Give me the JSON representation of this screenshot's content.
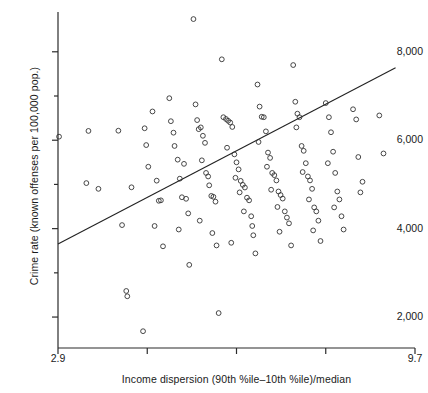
{
  "chart_data": {
    "type": "scatter",
    "title": "",
    "xlabel": "Income dispersion (90th %ile–10th %ile)/median",
    "ylabel": "Crime rate (known offenses per 100,000 pop.)",
    "xlim": [
      2.9,
      9.7
    ],
    "ylim": [
      1300,
      8900
    ],
    "grid": false,
    "legend": null,
    "xticks": [
      {
        "value": 2.9,
        "label": "2.9"
      },
      {
        "value": 4.6,
        "label": ""
      },
      {
        "value": 6.3,
        "label": ""
      },
      {
        "value": 8.0,
        "label": ""
      },
      {
        "value": 9.7,
        "label": "9.7"
      }
    ],
    "yticks": [
      {
        "value": 2000,
        "label": "2,000"
      },
      {
        "value": 3000,
        "label": ""
      },
      {
        "value": 4000,
        "label": "4,000"
      },
      {
        "value": 5000,
        "label": ""
      },
      {
        "value": 6000,
        "label": "6,000"
      },
      {
        "value": 7000,
        "label": ""
      },
      {
        "value": 8000,
        "label": "8,000"
      },
      {
        "value": 9000,
        "label": ""
      }
    ],
    "marker": {
      "style": "open-circle",
      "radius": 2.4,
      "color": "#333333"
    },
    "fit_line": {
      "label": "regression line",
      "color": "#222222",
      "x_start": 2.9,
      "y_start": 3650,
      "x_end": 9.33,
      "y_end": 7640
    },
    "points": [
      [
        2.92,
        6080
      ],
      [
        3.48,
        6210
      ],
      [
        3.44,
        5030
      ],
      [
        3.67,
        4900
      ],
      [
        4.05,
        6215
      ],
      [
        4.3,
        4935
      ],
      [
        4.12,
        4080
      ],
      [
        4.2,
        2590
      ],
      [
        4.22,
        2470
      ],
      [
        4.55,
        6270
      ],
      [
        4.58,
        5890
      ],
      [
        4.7,
        6650
      ],
      [
        4.62,
        5400
      ],
      [
        4.78,
        5085
      ],
      [
        4.82,
        4630
      ],
      [
        4.86,
        4640
      ],
      [
        4.74,
        4060
      ],
      [
        4.9,
        3600
      ],
      [
        4.52,
        1680
      ],
      [
        5.02,
        6950
      ],
      [
        5.05,
        6430
      ],
      [
        5.12,
        5870
      ],
      [
        5.1,
        6170
      ],
      [
        5.18,
        5560
      ],
      [
        5.22,
        5130
      ],
      [
        5.3,
        5465
      ],
      [
        5.26,
        4710
      ],
      [
        5.34,
        4675
      ],
      [
        5.38,
        4345
      ],
      [
        5.2,
        3980
      ],
      [
        5.4,
        3180
      ],
      [
        5.48,
        8740
      ],
      [
        5.52,
        6810
      ],
      [
        5.55,
        6455
      ],
      [
        5.58,
        6250
      ],
      [
        5.62,
        6290
      ],
      [
        5.66,
        6100
      ],
      [
        5.7,
        5940
      ],
      [
        5.64,
        5545
      ],
      [
        5.72,
        5260
      ],
      [
        5.76,
        5180
      ],
      [
        5.78,
        4980
      ],
      [
        5.82,
        4740
      ],
      [
        5.86,
        4720
      ],
      [
        5.9,
        4610
      ],
      [
        5.6,
        4180
      ],
      [
        5.84,
        3900
      ],
      [
        5.92,
        3620
      ],
      [
        5.96,
        2090
      ],
      [
        6.02,
        7830
      ],
      [
        6.05,
        6520
      ],
      [
        6.1,
        6480
      ],
      [
        6.14,
        6440
      ],
      [
        6.18,
        6400
      ],
      [
        6.22,
        6300
      ],
      [
        6.12,
        5830
      ],
      [
        6.26,
        5680
      ],
      [
        6.3,
        5500
      ],
      [
        6.34,
        5340
      ],
      [
        6.28,
        5150
      ],
      [
        6.38,
        5080
      ],
      [
        6.42,
        4990
      ],
      [
        6.46,
        4930
      ],
      [
        6.36,
        4820
      ],
      [
        6.5,
        4700
      ],
      [
        6.54,
        4640
      ],
      [
        6.44,
        4390
      ],
      [
        6.58,
        4280
      ],
      [
        6.6,
        4060
      ],
      [
        6.62,
        3850
      ],
      [
        6.2,
        3680
      ],
      [
        6.66,
        3440
      ],
      [
        6.7,
        7260
      ],
      [
        6.74,
        6760
      ],
      [
        6.78,
        6530
      ],
      [
        6.82,
        6520
      ],
      [
        6.86,
        6200
      ],
      [
        6.72,
        5960
      ],
      [
        6.9,
        5720
      ],
      [
        6.94,
        5600
      ],
      [
        6.88,
        5400
      ],
      [
        6.98,
        5260
      ],
      [
        7.02,
        5210
      ],
      [
        7.06,
        5090
      ],
      [
        6.96,
        4880
      ],
      [
        7.1,
        4840
      ],
      [
        7.14,
        4760
      ],
      [
        7.18,
        4680
      ],
      [
        7.08,
        4490
      ],
      [
        7.22,
        4390
      ],
      [
        7.26,
        4250
      ],
      [
        7.3,
        4120
      ],
      [
        7.12,
        3930
      ],
      [
        7.34,
        3620
      ],
      [
        7.38,
        7700
      ],
      [
        7.42,
        6870
      ],
      [
        7.46,
        6600
      ],
      [
        7.5,
        6520
      ],
      [
        7.44,
        6290
      ],
      [
        7.54,
        5870
      ],
      [
        7.58,
        5760
      ],
      [
        7.62,
        5480
      ],
      [
        7.56,
        5280
      ],
      [
        7.66,
        5180
      ],
      [
        7.7,
        5090
      ],
      [
        7.74,
        4900
      ],
      [
        7.68,
        4660
      ],
      [
        7.78,
        4480
      ],
      [
        7.82,
        4390
      ],
      [
        7.86,
        4180
      ],
      [
        7.76,
        3960
      ],
      [
        7.9,
        3720
      ],
      [
        8.0,
        6840
      ],
      [
        8.06,
        6520
      ],
      [
        8.1,
        6180
      ],
      [
        8.14,
        5740
      ],
      [
        8.04,
        5480
      ],
      [
        8.18,
        5260
      ],
      [
        8.22,
        4840
      ],
      [
        8.26,
        4660
      ],
      [
        8.16,
        4480
      ],
      [
        8.3,
        4280
      ],
      [
        8.34,
        3980
      ],
      [
        8.52,
        6700
      ],
      [
        8.58,
        6470
      ],
      [
        8.62,
        5620
      ],
      [
        8.7,
        5060
      ],
      [
        8.66,
        4820
      ],
      [
        9.02,
        6560
      ],
      [
        9.1,
        5700
      ]
    ]
  },
  "axes": {
    "x_axis_name": "income-dispersion-axis",
    "y_axis_name": "crime-rate-axis"
  }
}
